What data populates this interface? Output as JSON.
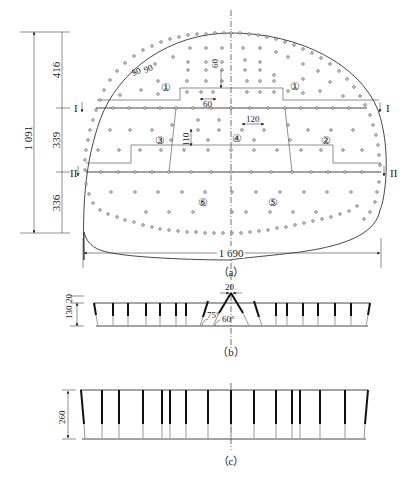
{
  "figure": {
    "panels": [
      {
        "id": "a",
        "caption": "（a）",
        "description": "Face hole layout (elevation)"
      },
      {
        "id": "b",
        "caption": "（b）",
        "description": "Section I-I: wedge cut"
      },
      {
        "id": "c",
        "caption": "（c）",
        "description": "Section II-II: straight holes"
      }
    ]
  },
  "panel_a": {
    "dimensions": {
      "total_height": "1 091",
      "upper_height": "416",
      "middle_height": "339",
      "lower_height": "336",
      "total_width": "1 690",
      "perimeter_spacing": "50",
      "perimeter_burden": "90",
      "hole_spacing_60_vertical": "60",
      "hole_spacing_60_horizontal": "60",
      "hole_spacing_120": "120",
      "hole_spacing_110": "110"
    },
    "section_marks": {
      "upper": "I",
      "lower": "II"
    },
    "zones": [
      "①",
      "①",
      "②",
      "③",
      "④",
      "⑤",
      "⑥"
    ],
    "caption": "（a）"
  },
  "panel_b": {
    "dimensions": {
      "depth": "130",
      "extra": "20",
      "top_gap": "20"
    },
    "angles": {
      "outer": "75°",
      "inner": "60°"
    },
    "caption": "（b）"
  },
  "panel_c": {
    "dimensions": {
      "depth": "260"
    },
    "caption": "（c）"
  }
}
